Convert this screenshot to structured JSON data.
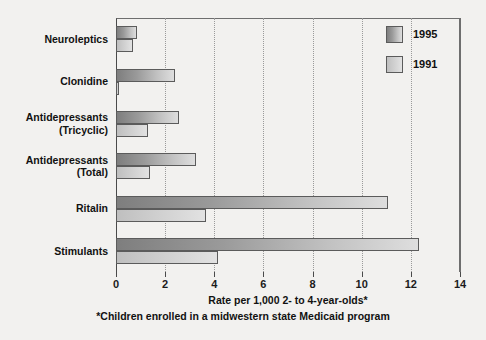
{
  "chart_data": {
    "type": "bar",
    "orientation": "horizontal",
    "title": "",
    "xlabel": "Rate per 1,000 2- to 4-year-olds*",
    "ylabel": "",
    "footnote": "*Children enrolled in a midwestern state Medicaid program",
    "categories": [
      "Neuroleptics",
      "Clonidine",
      "Antidepressants\n(Tricyclic)",
      "Antidepressants\n(Total)",
      "Ritalin",
      "Stimulants"
    ],
    "series": [
      {
        "name": "1995",
        "color": "#8e8e8e",
        "values": [
          0.85,
          2.4,
          2.55,
          3.25,
          11.05,
          12.35
        ]
      },
      {
        "name": "1991",
        "color": "#d2d2d2",
        "values": [
          0.68,
          0.12,
          1.3,
          1.4,
          3.65,
          4.15
        ]
      }
    ],
    "xlim": [
      0,
      14
    ],
    "xticks": [
      0,
      2,
      4,
      6,
      8,
      10,
      12,
      14
    ],
    "xtick_labels": [
      "0",
      "2",
      "4",
      "6",
      "8",
      "10",
      "12",
      "14"
    ],
    "grid": true,
    "grid_axis": "x",
    "legend_position": "top-right",
    "legend_entries": [
      "1995",
      "1991"
    ]
  },
  "colors": {
    "background": "#f2f1ef",
    "axis": "#4a4a4a",
    "grid": "#9a9a9a",
    "text": "#111111",
    "bar_1995_dark": "#7e7e7e",
    "bar_1995_light": "#dedede",
    "bar_1991_dark": "#bfbfbf",
    "bar_1991_light": "#e2e2e2"
  }
}
